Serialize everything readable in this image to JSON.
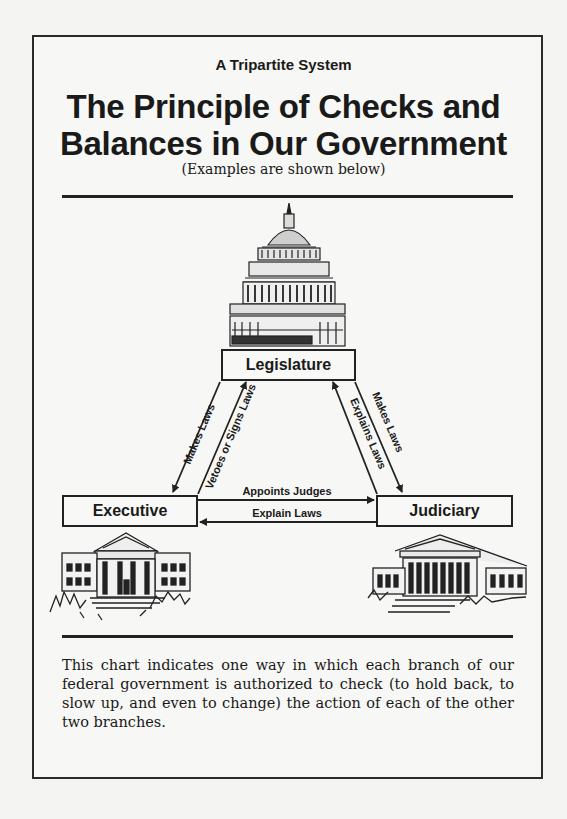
{
  "header": {
    "kicker": "A Tripartite System",
    "title_line1": "The Principle of Checks and",
    "title_line2": "Balances in Our Government",
    "subtitle": "(Examples are shown below)"
  },
  "diagram": {
    "branches": {
      "legislature": "Legislature",
      "executive": "Executive",
      "judiciary": "Judiciary"
    },
    "arrows": {
      "leg_to_exec": "Makes Laws",
      "exec_to_leg": "Vetoes or Signs Laws",
      "leg_to_jud": "Makes Laws",
      "jud_to_leg": "Explains Laws",
      "exec_to_jud": "Appoints Judges",
      "jud_to_exec": "Explain Laws"
    },
    "illustrations": [
      "capitol-building",
      "white-house",
      "supreme-court-building"
    ]
  },
  "caption": "This chart indicates one way in which each branch of our federal government is authorized to check (to hold back, to slow up, and even to change) the action of each of the other two branches."
}
